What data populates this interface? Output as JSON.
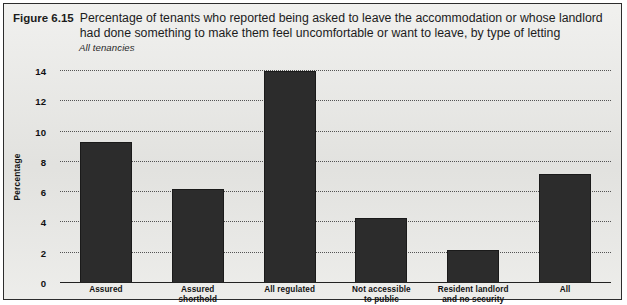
{
  "figure": {
    "number": "Figure 6.15",
    "title": "Percentage of tenants who reported being asked to leave the accommodation or whose landlord had done something to make them feel uncomfortable or want to leave, by type of letting",
    "subtitle": "All tenancies"
  },
  "colors": {
    "bar": "#2c2c2c",
    "background": "#e9e9e6",
    "frame": "#2d2d2d",
    "gridline": "#3a3a3a",
    "text": "#111111"
  },
  "chart_data": {
    "type": "bar",
    "title": "Percentage of tenants who reported being asked to leave the accommodation or whose landlord had done something to make them feel uncomfortable or want to leave, by type of letting",
    "subtitle": "All tenancies",
    "categories": [
      "Assured",
      "Assured shorthold",
      "All regulated",
      "Not accessible to public",
      "Resident landlord and no security",
      "All"
    ],
    "category_lines": [
      [
        "Assured"
      ],
      [
        "Assured",
        "shorthold"
      ],
      [
        "All regulated"
      ],
      [
        "Not accessible",
        "to public"
      ],
      [
        "Resident landlord",
        "and no security"
      ],
      [
        "All"
      ]
    ],
    "values": [
      9.3,
      6.2,
      14.0,
      4.3,
      2.2,
      7.2
    ],
    "xlabel": "",
    "ylabel": "Percentage",
    "ylim": [
      0,
      14
    ],
    "yticks": [
      0,
      2,
      4,
      6,
      8,
      10,
      12,
      14
    ],
    "ytick_labels": [
      "0",
      "2",
      "4",
      "6",
      "8",
      "10",
      "12",
      "14"
    ],
    "grid": true,
    "grid_style": "dotted-horizontal",
    "legend": false
  }
}
